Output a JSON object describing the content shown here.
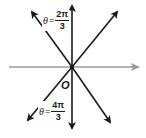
{
  "diagram": {
    "title": "",
    "colors": {
      "axis": "#9a9a9a",
      "lines": "#1a1a1a",
      "background": "#ffffff"
    },
    "origin_label": "O",
    "labels": {
      "upper": {
        "var": "θ",
        "eq": "=",
        "num": "2π",
        "den": "3"
      },
      "lower": {
        "var": "θ",
        "eq": "=",
        "num": "4π",
        "den": "3"
      }
    },
    "elements": [
      {
        "type": "polar-axis",
        "color": "gray",
        "direction": "right",
        "arrow": true
      },
      {
        "type": "line",
        "angles": [
          "π/2",
          "3π/2"
        ],
        "arrows": "both"
      },
      {
        "type": "line",
        "angles": [
          "2π/3",
          "5π/3"
        ],
        "arrows": "both"
      },
      {
        "type": "line",
        "angles": [
          "π/3",
          "4π/3"
        ],
        "arrows": "both"
      }
    ]
  }
}
